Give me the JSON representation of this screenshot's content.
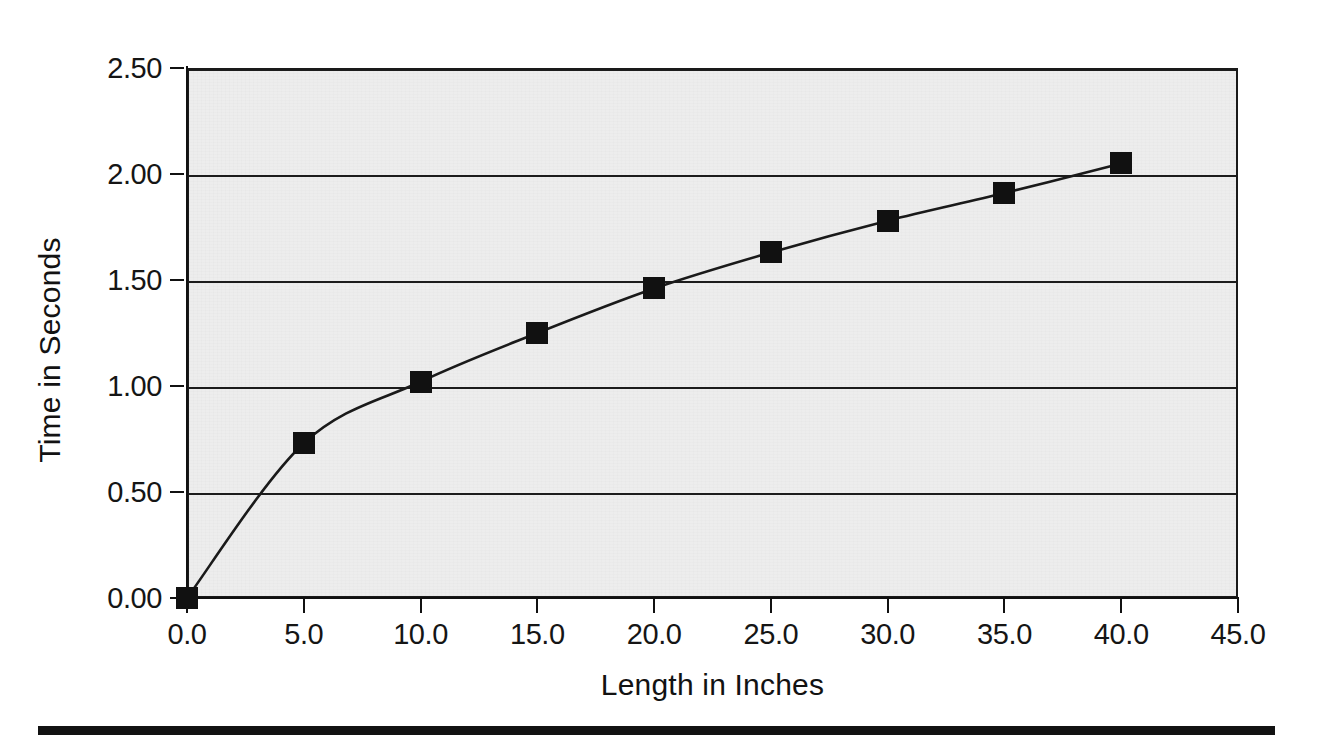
{
  "chart_data": {
    "type": "line",
    "title": "",
    "subtitle": "",
    "xlabel": "Length in Inches",
    "ylabel": "Time in Seconds",
    "xlim": [
      0.0,
      45.0
    ],
    "ylim": [
      0.0,
      2.5
    ],
    "xticks": [
      0.0,
      5.0,
      10.0,
      15.0,
      20.0,
      25.0,
      30.0,
      35.0,
      40.0,
      45.0
    ],
    "yticks": [
      0.0,
      0.5,
      1.0,
      1.5,
      2.0,
      2.5
    ],
    "xtick_labels": [
      "0.0",
      "5.0",
      "10.0",
      "15.0",
      "20.0",
      "25.0",
      "30.0",
      "35.0",
      "40.0",
      "45.0"
    ],
    "ytick_labels": [
      "0.00",
      "0.50",
      "1.00",
      "1.50",
      "2.00",
      "2.50"
    ],
    "grid": "horizontal",
    "legend": "none",
    "marker": "square",
    "marker_color": "#111111",
    "line_color": "#1a1a1a",
    "plot_background": "#ededed",
    "x": [
      0,
      5,
      10,
      15,
      20,
      25,
      30,
      35,
      40
    ],
    "values": [
      0.0,
      0.73,
      1.02,
      1.25,
      1.46,
      1.63,
      1.78,
      1.91,
      2.05
    ],
    "series": [
      {
        "name": "Time vs Length",
        "points": [
          {
            "x": 0,
            "y": 0.0
          },
          {
            "x": 5,
            "y": 0.73
          },
          {
            "x": 10,
            "y": 1.02
          },
          {
            "x": 15,
            "y": 1.25
          },
          {
            "x": 20,
            "y": 1.46
          },
          {
            "x": 25,
            "y": 1.63
          },
          {
            "x": 30,
            "y": 1.78
          },
          {
            "x": 35,
            "y": 1.91
          },
          {
            "x": 40,
            "y": 2.05
          }
        ]
      }
    ]
  },
  "figure": {
    "axis_title_x": "Length in Inches",
    "axis_title_y": "Time in Seconds"
  }
}
